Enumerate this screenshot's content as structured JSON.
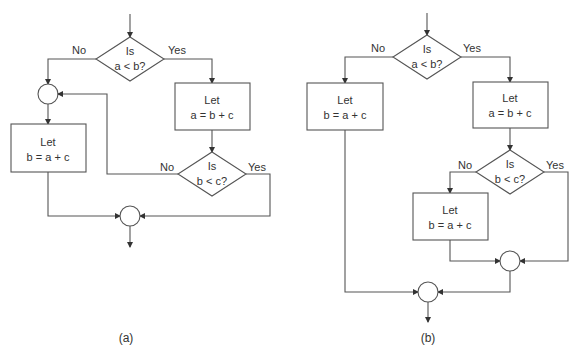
{
  "diagram": {
    "colors": {
      "line": "#555555",
      "text": "#333333",
      "background": "#ffffff"
    },
    "flowchart_a": {
      "caption": "(a)",
      "decision1": {
        "line1": "Is",
        "line2": "a < b?",
        "no_label": "No",
        "yes_label": "Yes"
      },
      "process_left": {
        "line1": "Let",
        "line2": "b = a + c"
      },
      "process_right": {
        "line1": "Let",
        "line2": "a = b + c"
      },
      "decision2": {
        "line1": "Is",
        "line2": "b < c?",
        "no_label": "No",
        "yes_label": "Yes"
      }
    },
    "flowchart_b": {
      "caption": "(b)",
      "decision1": {
        "line1": "Is",
        "line2": "a < b?",
        "no_label": "No",
        "yes_label": "Yes"
      },
      "process_left": {
        "line1": "Let",
        "line2": "b = a + c"
      },
      "process_right": {
        "line1": "Let",
        "line2": "a = b + c"
      },
      "decision2": {
        "line1": "Is",
        "line2": "b < c?",
        "no_label": "No",
        "yes_label": "Yes"
      },
      "process_inner": {
        "line1": "Let",
        "line2": "b = a + c"
      }
    }
  }
}
